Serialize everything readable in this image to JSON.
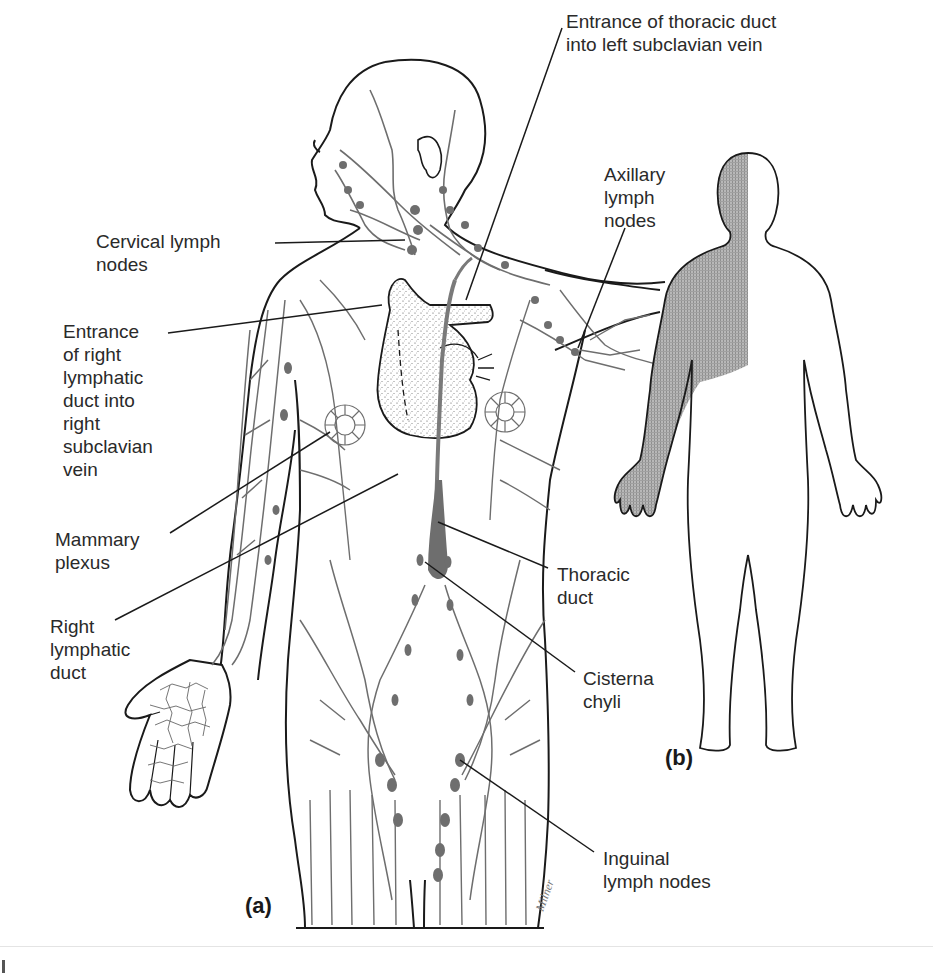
{
  "figure": {
    "title_fragment": "",
    "panels": [
      {
        "id": "a",
        "tag": "(a)",
        "description": "Anterior view of human torso, head and right arm showing lymphatic vessels and nodes"
      },
      {
        "id": "b",
        "tag": "(b)",
        "description": "Body outline with shaded region drained by right lymphatic duct"
      }
    ],
    "labels": {
      "thoracic_entrance": "Entrance of thoracic duct\ninto left subclavian vein",
      "axillary": "Axillary\nlymph\nnodes",
      "cervical": "Cervical lymph\nnodes",
      "right_entrance": "Entrance\nof right\nlymphatic\nduct into\nright\nsubclavian\nvein",
      "mammary": "Mammary\nplexus",
      "right_duct": "Right\nlymphatic\nduct",
      "thoracic_duct": "Thoracic\nduct",
      "cisterna": "Cisterna\nchyli",
      "inguinal": "Inguinal\nlymph nodes"
    },
    "signature": "Milner",
    "colors": {
      "outline": "#1a1a1a",
      "lymph": "#6e6e6e",
      "shade": "#9a9a9a",
      "label": "#2a2a2a"
    }
  }
}
